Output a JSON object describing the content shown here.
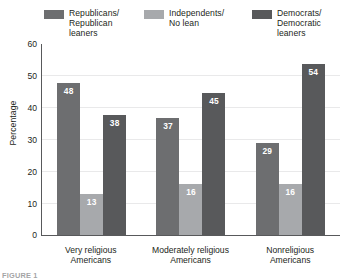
{
  "legend": {
    "items": [
      {
        "label": "Republicans/\nRepublican\nleaners",
        "color": "#6d6e70",
        "swatch_name": "legend-swatch-republicans"
      },
      {
        "label": "Independents/\nNo lean",
        "color": "#a7a9ac",
        "swatch_name": "legend-swatch-independents"
      },
      {
        "label": "Democrats/\nDemocratic\nleaners",
        "color": "#58595b",
        "swatch_name": "legend-swatch-democrats"
      }
    ]
  },
  "axis": {
    "ylabel": "Percentage",
    "yticks": [
      "60",
      "50",
      "40",
      "30",
      "20",
      "10",
      "0"
    ]
  },
  "categories": [
    "Very religious\nAmericans",
    "Moderately religious\nAmericans",
    "Nonreligious\nAmericans"
  ],
  "bars": {
    "g0": [
      {
        "value": "48",
        "color": "#6d6e70"
      },
      {
        "value": "13",
        "color": "#a7a9ac"
      },
      {
        "value": "38",
        "color": "#58595b"
      }
    ],
    "g1": [
      {
        "value": "37",
        "color": "#6d6e70"
      },
      {
        "value": "16",
        "color": "#a7a9ac"
      },
      {
        "value": "45",
        "color": "#58595b"
      }
    ],
    "g2": [
      {
        "value": "29",
        "color": "#6d6e70"
      },
      {
        "value": "16",
        "color": "#a7a9ac"
      },
      {
        "value": "54",
        "color": "#58595b"
      }
    ]
  },
  "caption": "FIGURE 1",
  "chart_data": {
    "type": "bar",
    "title": "",
    "xlabel": "",
    "ylabel": "Percentage",
    "ylim": [
      0,
      60
    ],
    "yticks": [
      0,
      10,
      20,
      30,
      40,
      50,
      60
    ],
    "grid": true,
    "legend_position": "top",
    "categories": [
      "Very religious Americans",
      "Moderately religious Americans",
      "Nonreligious Americans"
    ],
    "series": [
      {
        "name": "Republicans/Republican leaners",
        "color": "#6d6e70",
        "values": [
          48,
          37,
          29
        ]
      },
      {
        "name": "Independents/No lean",
        "color": "#a7a9ac",
        "values": [
          13,
          16,
          16
        ]
      },
      {
        "name": "Democrats/Democratic leaners",
        "color": "#58595b",
        "values": [
          38,
          45,
          54
        ]
      }
    ]
  }
}
